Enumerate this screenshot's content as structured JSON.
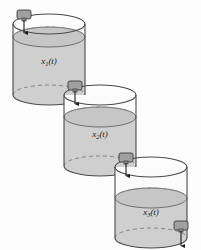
{
  "figure": {
    "background_color": "#fdfdfd",
    "width": 201,
    "height": 250
  },
  "style": {
    "outline_color": "#4a4a4a",
    "water_fill": "#cfcfcf",
    "water_surface_fill": "#c6c6c6",
    "water_surface_stroke": "#6e6e6e",
    "valve_fill": "#a0a0a0",
    "valve_stroke": "#3d3d3d",
    "arrow_color": "#1c1c1c",
    "dash_color": "#7a7a7a",
    "tank_glass_fill": "#fbfbfb"
  },
  "tanks": [
    {
      "id": "tank-1",
      "label": "x",
      "label_subscript": "1",
      "label_suffix": "(t)",
      "label_full": "x1(t)",
      "state_variable": "x1",
      "cx": 49,
      "cy_top": 24,
      "cy_bottom": 95,
      "rx": 36,
      "ry": 10,
      "water_level_y": 37,
      "label_x": 49,
      "label_y": 64
    },
    {
      "id": "tank-2",
      "label": "x",
      "label_subscript": "2",
      "label_suffix": "(t)",
      "label_full": "x2(t)",
      "state_variable": "x2",
      "cx": 100,
      "cy_top": 95,
      "cy_bottom": 166,
      "rx": 36,
      "ry": 10,
      "water_level_y": 117,
      "label_x": 100,
      "label_y": 137
    },
    {
      "id": "tank-3",
      "label": "x",
      "label_subscript": "3",
      "label_suffix": "(t)",
      "label_full": "x3(t)",
      "state_variable": "x3",
      "cx": 151,
      "cy_top": 167,
      "cy_bottom": 238,
      "rx": 36,
      "ry": 10,
      "water_level_y": 198,
      "label_x": 151,
      "label_y": 215
    }
  ],
  "valves": [
    {
      "id": "valve-inlet",
      "name": "inlet-valve",
      "role": "External inflow into tank 1",
      "x": 17,
      "y": 10,
      "w": 14,
      "h": 9,
      "nozzle_x": 24,
      "arrow_from_y": 19,
      "arrow_to_y": 33
    },
    {
      "id": "valve-1-2",
      "name": "tank1-to-tank2-valve",
      "role": "Drain valve from tank 1 into tank 2",
      "x": 68,
      "y": 81,
      "w": 14,
      "h": 9,
      "nozzle_x": 75,
      "arrow_from_y": 90,
      "arrow_to_y": 104
    },
    {
      "id": "valve-2-3",
      "name": "tank2-to-tank3-valve",
      "role": "Drain valve from tank 2 into tank 3",
      "x": 119,
      "y": 153,
      "w": 14,
      "h": 9,
      "nozzle_x": 126,
      "arrow_from_y": 162,
      "arrow_to_y": 176
    },
    {
      "id": "valve-outlet",
      "name": "outlet-valve",
      "role": "Drain valve from tank 3 to outside",
      "x": 174,
      "y": 221,
      "w": 14,
      "h": 9,
      "nozzle_x": 181,
      "arrow_from_y": 230,
      "arrow_to_y": 245
    }
  ]
}
